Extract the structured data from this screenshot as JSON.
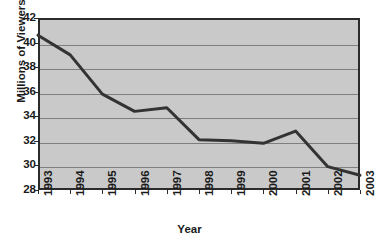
{
  "chart_data": {
    "type": "line",
    "title": "",
    "xlabel": "Year",
    "ylabel": "Millions of Viewers",
    "categories": [
      "1993",
      "1994",
      "1995",
      "1996",
      "1997",
      "1998",
      "1999",
      "2000",
      "2001",
      "2002",
      "2003"
    ],
    "x": [
      1993,
      1994,
      1995,
      1996,
      1997,
      1998,
      1999,
      2000,
      2001,
      2002,
      2003
    ],
    "values": [
      40.6,
      39.0,
      35.8,
      34.4,
      34.7,
      32.1,
      32.0,
      31.8,
      32.8,
      29.9,
      29.2
    ],
    "series": [
      {
        "name": "Viewers",
        "values": [
          40.6,
          39.0,
          35.8,
          34.4,
          34.7,
          32.1,
          32.0,
          31.8,
          32.8,
          29.9,
          29.2
        ]
      }
    ],
    "ylim": [
      28,
      42
    ],
    "xlim": [
      1993,
      2003
    ],
    "ytick_labels": [
      "42",
      "40",
      "38",
      "36",
      "34",
      "32",
      "30",
      "28"
    ],
    "yticks": [
      42,
      40,
      38,
      36,
      34,
      32,
      30,
      28
    ],
    "grid": true,
    "grid_axis": "y",
    "legend": false,
    "legend_position": "none",
    "colors": {
      "plot_background": "#c9c9c9",
      "gridline": "#7e7e7e",
      "line": "#333333",
      "axis": "#2b2b2b",
      "text": "#1a1a1a",
      "page_background": "#ffffff"
    },
    "line_width": 3
  }
}
